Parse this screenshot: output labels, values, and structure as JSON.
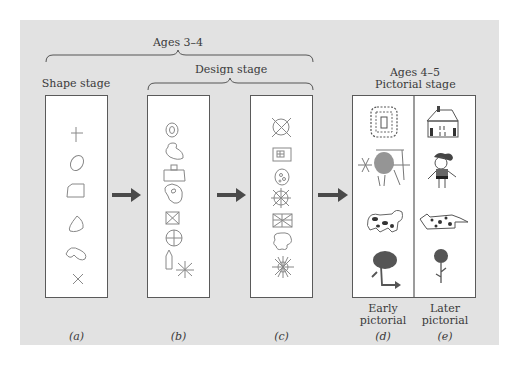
{
  "diagram": {
    "groups": {
      "ages_3_4": "Ages 3–4",
      "design_stage": "Design stage",
      "shape_stage": "Shape stage",
      "ages_4_5": "Ages 4–5",
      "pictorial_stage": "Pictorial stage"
    },
    "panels": [
      {
        "id": "a",
        "caption": "(a)",
        "stage": "Shape stage",
        "drawings": [
          "cross",
          "oval",
          "rectangle",
          "triangle",
          "bean",
          "x-mark"
        ]
      },
      {
        "id": "b",
        "caption": "(b)",
        "stage": "Design stage",
        "drawings": [
          "concentric-oval",
          "blob-combo",
          "rect-with-square",
          "spiral-blob",
          "boxed-x",
          "circled-cross",
          "pointed-rect",
          "asterisk"
        ]
      },
      {
        "id": "c",
        "caption": "(c)",
        "stage": "Design stage",
        "drawings": [
          "crossed-circle",
          "boxed-window",
          "circle-with-dots",
          "sun-wheel",
          "boxed-star",
          "cloud-flower",
          "spiky-sun"
        ]
      },
      {
        "id": "d",
        "caption": "(d)",
        "sublabel_1": "Early",
        "sublabel_2": "pictorial",
        "drawings": [
          "dotted-house",
          "scribbled-person",
          "spotted-animal",
          "tree"
        ]
      },
      {
        "id": "e",
        "caption": "(e)",
        "sublabel_1": "Later",
        "sublabel_2": "pictorial",
        "drawings": [
          "house",
          "person",
          "spotted-animal",
          "flower"
        ]
      }
    ],
    "arrows": [
      "a-to-b",
      "b-to-c",
      "c-to-d"
    ],
    "colors": {
      "panel_bg": "#e2e2e2",
      "box_bg": "#ffffff",
      "box_border": "#5a5a5a",
      "arrow": "#4a4a4a",
      "sketch": "#6a6a6a",
      "text": "#3a3a3a"
    }
  }
}
